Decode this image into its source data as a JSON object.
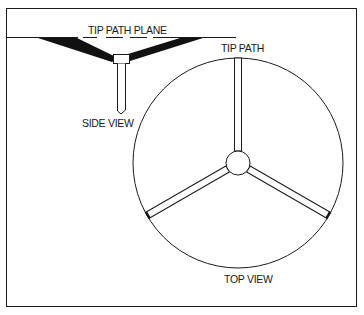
{
  "figure": {
    "type": "rotor-tip-path-diagram",
    "colors": {
      "line": "#1a1a1a",
      "background": "#ffffff"
    }
  },
  "side_view": {
    "plane_label": "TIP PATH PLANE",
    "caption": "SIDE VIEW"
  },
  "top_view": {
    "tip_label": "TIP PATH",
    "caption": "TOP VIEW",
    "blade_count": 3
  }
}
